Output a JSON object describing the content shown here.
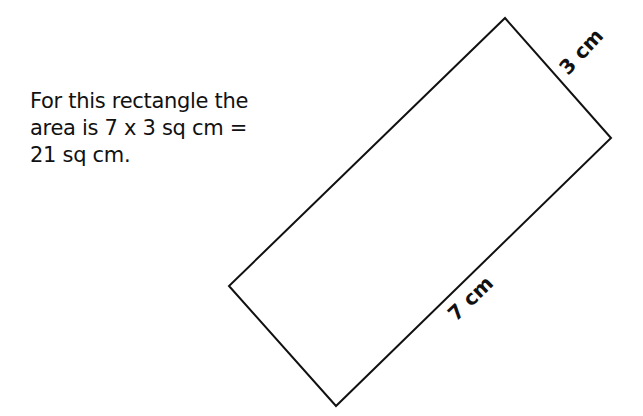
{
  "caption": {
    "lines": [
      "For this rectangle the",
      "area is 7 x 3 sq cm =",
      "21 sq cm."
    ]
  },
  "diagram": {
    "shape": "rectangle",
    "stroke_color": "#111111",
    "short_side_label": "3 cm",
    "long_side_label": "7 cm",
    "width_cm": 7,
    "height_cm": 3,
    "area_sq_cm": 21
  }
}
